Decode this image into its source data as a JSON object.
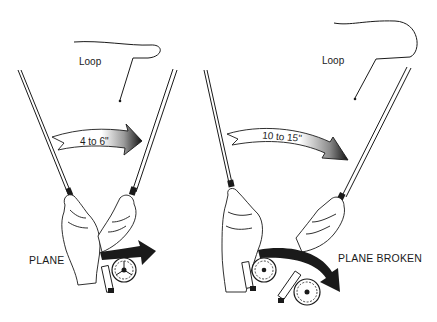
{
  "illustration": {
    "subject": "fly casting rod motion comparison",
    "background": "#ffffff",
    "ink": "#1a1a1a",
    "panels": [
      {
        "id": "left",
        "loop_label": "Loop",
        "arrow_label": "4 to 6\"",
        "caption": "PLANE"
      },
      {
        "id": "right",
        "loop_label": "Loop",
        "arrow_label": "10 to 15\"",
        "caption": "PLANE BROKEN"
      }
    ]
  }
}
